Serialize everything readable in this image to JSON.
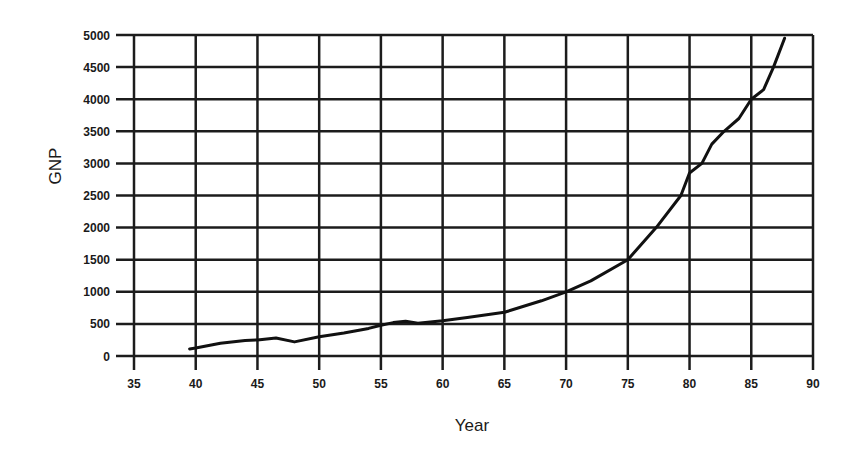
{
  "chart_data": {
    "type": "line",
    "title": "",
    "xlabel": "Year",
    "ylabel": "GNP",
    "xlim": [
      35,
      90
    ],
    "ylim": [
      0,
      5000
    ],
    "x_ticks": [
      35,
      40,
      45,
      50,
      55,
      60,
      65,
      70,
      75,
      80,
      85,
      90
    ],
    "y_ticks": [
      0,
      500,
      1000,
      1500,
      2000,
      2500,
      3000,
      3500,
      4000,
      4500,
      5000
    ],
    "grid": true,
    "legend": null,
    "series": [
      {
        "name": "GNP",
        "x": [
          39.5,
          40,
          42,
          44,
          45,
          46.5,
          48,
          50,
          52,
          54,
          55,
          56,
          57,
          58,
          60,
          62,
          65,
          68,
          70,
          72,
          75,
          77.3,
          79.3,
          80,
          81,
          81.8,
          82.8,
          84,
          85,
          86,
          86.8,
          87.7
        ],
        "values": [
          110,
          125,
          200,
          240,
          250,
          280,
          220,
          300,
          360,
          430,
          480,
          520,
          540,
          510,
          550,
          600,
          680,
          860,
          1000,
          1170,
          1500,
          2000,
          2500,
          2850,
          3000,
          3300,
          3500,
          3700,
          4000,
          4150,
          4500,
          4950
        ]
      }
    ]
  },
  "labels": {
    "xlabel": "Year",
    "ylabel": "GNP"
  }
}
